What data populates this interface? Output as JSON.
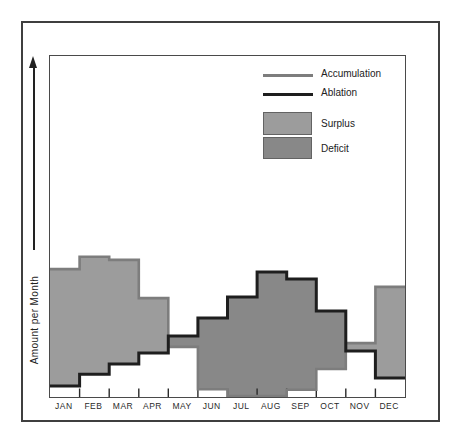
{
  "figure": {
    "y_axis_label": "Amount per Month",
    "legend": {
      "accumulation_label": "Accumulation",
      "ablation_label": "Ablation",
      "surplus_label": "Surplus",
      "deficit_label": "Deficit"
    },
    "months": [
      "JAN",
      "FEB",
      "MAR",
      "APR",
      "MAY",
      "JUN",
      "JUL",
      "AUG",
      "SEP",
      "OCT",
      "NOV",
      "DEC"
    ]
  },
  "colors": {
    "accumulation_line": "#7d7d7d",
    "ablation_line": "#1e1e1e",
    "surplus_fill": "#9c9c9c",
    "deficit_fill": "#888888",
    "axis": "#222222",
    "tick": "#2a2a2a"
  },
  "chart_data": {
    "type": "area",
    "subtype": "stepped-mass-balance",
    "categories": [
      "JAN",
      "FEB",
      "MAR",
      "APR",
      "MAY",
      "JUN",
      "JUL",
      "AUG",
      "SEP",
      "OCT",
      "NOV",
      "DEC"
    ],
    "series": [
      {
        "name": "Accumulation",
        "values": [
          37.5,
          41.1,
          40.2,
          29.0,
          14.7,
          2.3,
          0.3,
          0.3,
          2.1,
          8.2,
          15.8,
          32.3
        ]
      },
      {
        "name": "Ablation",
        "values": [
          3.2,
          6.7,
          9.7,
          12.9,
          17.9,
          23.2,
          29.3,
          36.7,
          34.6,
          25.2,
          13.5,
          5.6
        ]
      }
    ],
    "regions": [
      {
        "name": "Surplus",
        "rule": "accumulation above ablation",
        "months": [
          "JAN",
          "FEB",
          "MAR",
          "APR",
          "NOV",
          "DEC"
        ]
      },
      {
        "name": "Deficit",
        "rule": "ablation above accumulation",
        "months": [
          "MAY",
          "JUN",
          "JUL",
          "AUG",
          "SEP",
          "OCT"
        ]
      }
    ],
    "title": "",
    "xlabel": "",
    "ylabel": "Amount per Month",
    "ylim": [
      0,
      100
    ],
    "y_units": "relative (axis unlabeled)",
    "grid": false,
    "legend_position": "top-right"
  }
}
